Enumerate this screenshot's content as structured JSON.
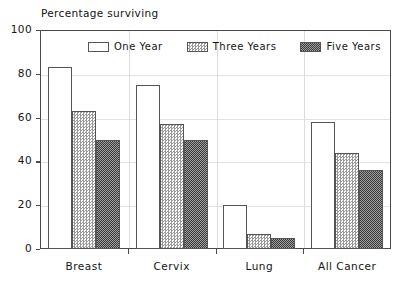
{
  "chart_data": {
    "type": "bar",
    "title": "Percentage surviving",
    "xlabel": "",
    "ylabel": "",
    "categories": [
      "Breast",
      "Cervix",
      "Lung",
      "All Cancer"
    ],
    "series": [
      {
        "name": "One Year",
        "values": [
          83,
          75,
          20,
          58
        ]
      },
      {
        "name": "Three Years",
        "values": [
          63,
          57,
          7,
          44
        ]
      },
      {
        "name": "Five Years",
        "values": [
          50,
          50,
          5,
          36
        ]
      }
    ],
    "ylim": [
      0,
      100
    ],
    "yticks": [
      0,
      20,
      40,
      60,
      80,
      100
    ],
    "ytick_labels": [
      "0",
      "20",
      "40",
      "60",
      "80",
      "100"
    ],
    "grid": true,
    "legend_position": "top-center-inside",
    "colors": {
      "series_one_year": "#ffffff",
      "series_three_years": "#9a9a9a",
      "series_five_years": "#4a4a4a",
      "axis": "#4a4a4a",
      "grid": "#e2e2e2",
      "text": "#141414",
      "background": "#ffffff"
    }
  }
}
